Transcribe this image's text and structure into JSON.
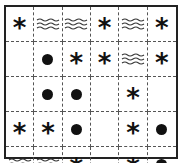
{
  "grid": {
    "rows": 5,
    "cols": 6,
    "cells": [
      [
        "star",
        "wave",
        "wave",
        "star",
        "wave",
        "star"
      ],
      [
        "empty",
        "dot",
        "star",
        "star",
        "wave",
        "star"
      ],
      [
        "empty",
        "dot",
        "dot",
        "empty",
        "star",
        "empty"
      ],
      [
        "star",
        "star",
        "dot",
        "empty",
        "star",
        "dot"
      ],
      [
        "wave",
        "wave",
        "star",
        "empty",
        "star",
        "dot"
      ]
    ],
    "symbols": {
      "star": "*",
      "dot": "●",
      "wave": "≈",
      "empty": ""
    }
  }
}
